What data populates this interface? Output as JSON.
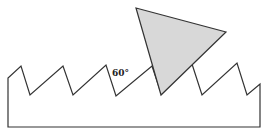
{
  "diagram": {
    "angle_label": "60°",
    "colors": {
      "stroke": "#333333",
      "triangle_fill": "#d8d8d8",
      "background": "#ffffff"
    },
    "shapes": {
      "saw_profile": "serrated workpiece with sawtooth top edge",
      "triangle": "shaded triangular cutting tool"
    }
  }
}
